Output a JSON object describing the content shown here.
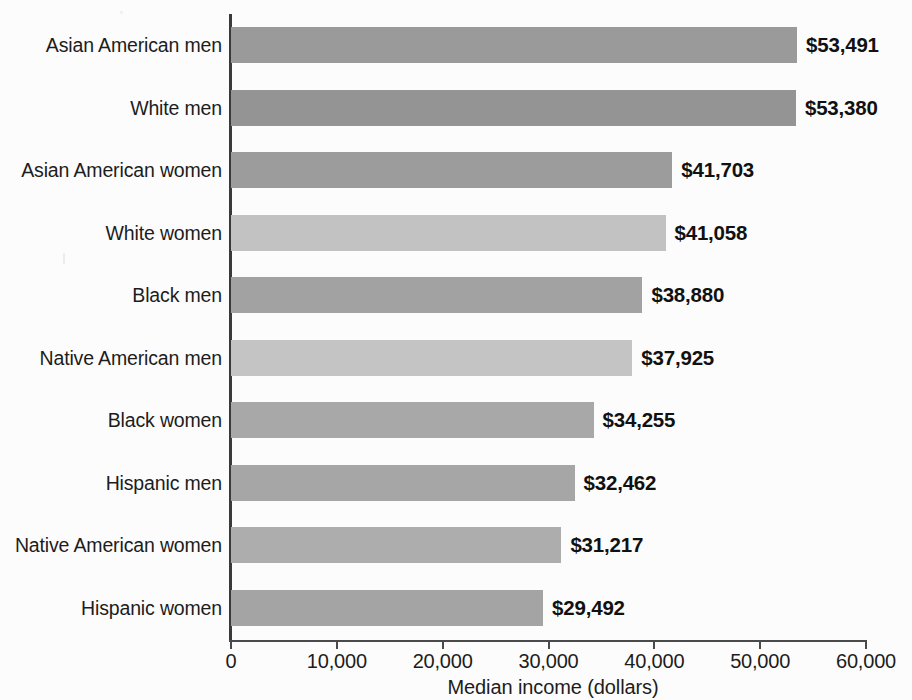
{
  "chart_data": {
    "type": "bar",
    "orientation": "horizontal",
    "title": "",
    "xlabel": "Median income (dollars)",
    "ylabel": "",
    "xlim": [
      0,
      60000
    ],
    "xticks": [
      0,
      10000,
      20000,
      30000,
      40000,
      50000,
      60000
    ],
    "xtick_labels": [
      "0",
      "10,000",
      "20,000",
      "30,000",
      "40,000",
      "50,000",
      "60,000"
    ],
    "grid": false,
    "legend": null,
    "categories": [
      "Asian American men",
      "White men",
      "Asian American women",
      "White women",
      "Black men",
      "Native American men",
      "Black women",
      "Hispanic men",
      "Native American women",
      "Hispanic women"
    ],
    "values": [
      53491,
      53380,
      41703,
      41058,
      38880,
      37925,
      34255,
      32462,
      31217,
      29492
    ],
    "data_labels": [
      "$53,491",
      "$53,380",
      "$41,703",
      "$41,058",
      "$38,880",
      "$37,925",
      "$34,255",
      "$32,462",
      "$31,217",
      "$29,492"
    ],
    "bar_colors": [
      "#9a9a9a",
      "#949494",
      "#9c9c9c",
      "#c2c2c2",
      "#a2a2a2",
      "#c4c4c4",
      "#a8a8a8",
      "#a6a6a6",
      "#adadad",
      "#a4a4a4"
    ]
  },
  "colors": {
    "background": "#fcfcfc",
    "axis": "#3a3a3a",
    "text": "#1d1d1d",
    "value_text": "#111111",
    "bar_dark": "#949494",
    "bar_light": "#c4c4c4"
  }
}
